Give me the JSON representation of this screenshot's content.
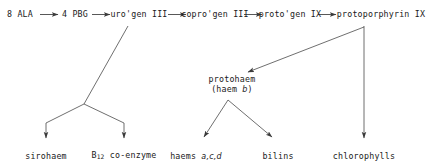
{
  "diagram": {
    "type": "flow-diagram",
    "background_color": "#ffffff",
    "line_color": "#444444",
    "text_color": "#1a1a1a",
    "width": 432,
    "height": 168
  },
  "nodes": {
    "ala": "8 ALA",
    "pbg": "4 PBG",
    "urogen": "uro'gen III",
    "coprogen": "copro'gen III",
    "protogen": "proto'gen IX",
    "protoporphyrin": "protoporphyrin IX",
    "protohaem_line1": "protohaem",
    "protohaem_line2_pre": "(haem ",
    "protohaem_line2_ital": "b",
    "protohaem_line2_post": ")",
    "sirohaem": "sirohaem",
    "b12_symbol": "B",
    "b12_subscript": "12",
    "b12_rest": " co-enzyme",
    "haems_pre": "haems ",
    "haems_ital": "a,c,d",
    "bilins": "bilins",
    "chlorophylls": "chlorophylls"
  },
  "edges": [
    {
      "name": "ala-to-pbg",
      "from": "8 ALA",
      "to": "4 PBG",
      "style": "horizontal-arrow"
    },
    {
      "name": "pbg-to-urogen",
      "from": "4 PBG",
      "to": "uro'gen III",
      "style": "horizontal-arrow"
    },
    {
      "name": "urogen-to-coprogen",
      "from": "uro'gen III",
      "to": "copro'gen III",
      "style": "horizontal-arrow"
    },
    {
      "name": "coprogen-to-protogen",
      "from": "copro'gen III",
      "to": "proto'gen IX",
      "style": "horizontal-arrow"
    },
    {
      "name": "protogen-to-protoporphyrin",
      "from": "proto'gen IX",
      "to": "protoporphyrin IX",
      "style": "horizontal-arrow"
    },
    {
      "name": "urogen-to-sirohaem",
      "from": "uro'gen III",
      "to": "sirohaem",
      "style": "branch-arrow"
    },
    {
      "name": "urogen-to-b12",
      "from": "uro'gen III",
      "to": "B12 co-enzyme",
      "style": "branch-arrow"
    },
    {
      "name": "protoporphyrin-to-protohaem",
      "from": "protoporphyrin IX",
      "to": "protohaem",
      "style": "diagonal-arrow"
    },
    {
      "name": "protohaem-to-haems",
      "from": "protohaem",
      "to": "haems a,c,d",
      "style": "branch-arrow"
    },
    {
      "name": "protohaem-to-bilins",
      "from": "protohaem",
      "to": "bilins",
      "style": "branch-arrow"
    },
    {
      "name": "protoporphyrin-to-chlorophylls",
      "from": "protoporphyrin IX",
      "to": "chlorophylls",
      "style": "vertical-arrow"
    }
  ]
}
